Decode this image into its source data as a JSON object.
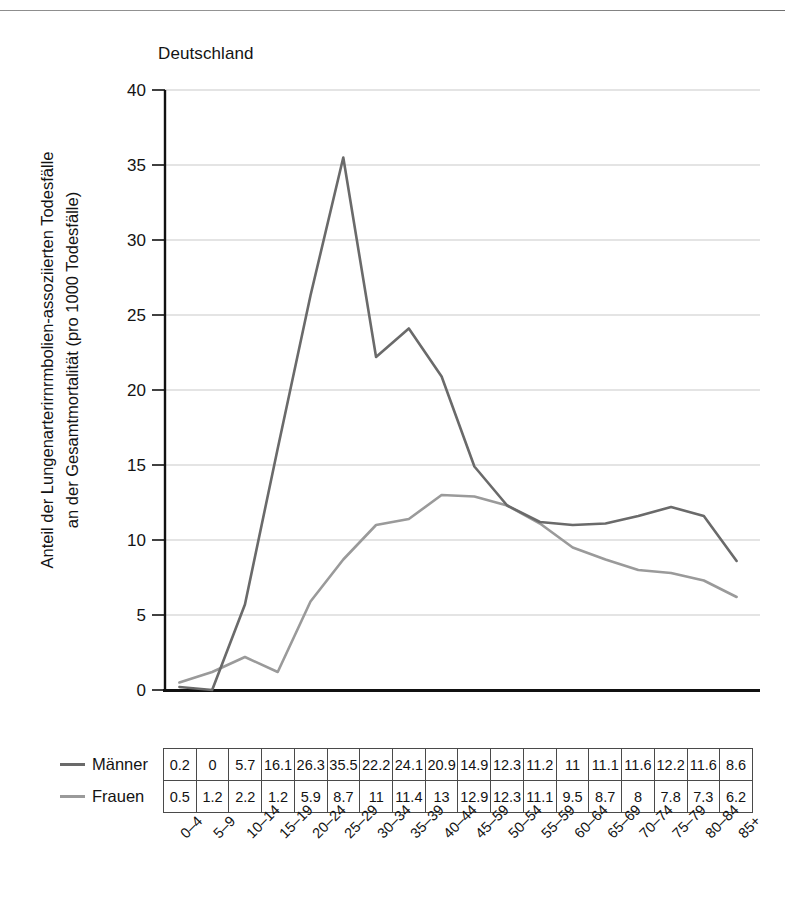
{
  "chart_title": "Deutschland",
  "axis": {
    "ylabel_line1": "Anteil der Lungenarterirnrmbolien-assoziierten Todesfälle",
    "ylabel_line2": "an der Gesamtmortalität (pro 1000 Todesfälle)",
    "yticks": [
      "40",
      "35",
      "30",
      "25",
      "20",
      "15",
      "10",
      "5",
      "0"
    ]
  },
  "legend": {
    "items": [
      {
        "label": "Männer",
        "color": "#6a6a6a"
      },
      {
        "label": "Frauen",
        "color": "#9a9a9a"
      }
    ]
  },
  "colors": {
    "maenner_line": "#6a6a6a",
    "frauen_line": "#9a9a9a",
    "gridline": "#c9c9c9",
    "axis": "#111111",
    "table_border": "#4a4a4a"
  },
  "chart_data": {
    "type": "line",
    "title": "Deutschland",
    "xlabel": "",
    "ylabel": "Anteil der Lungenarterirnrmbolien-assoziierten Todesfälle an der Gesamtmortalität (pro 1000 Todesfälle)",
    "categories": [
      "0–4",
      "5–9",
      "10–14",
      "15–19",
      "20–24",
      "25–29",
      "30–34",
      "35–39",
      "40–44",
      "45–59",
      "50–54",
      "55–59",
      "60–64",
      "65–69",
      "70–74",
      "75–79",
      "80–84",
      "85+"
    ],
    "series": [
      {
        "name": "Männer",
        "color": "#6a6a6a",
        "values": [
          0.2,
          0,
          5.7,
          16.1,
          26.3,
          35.5,
          22.2,
          24.1,
          20.9,
          14.9,
          12.3,
          11.2,
          11,
          11.1,
          11.6,
          12.2,
          11.6,
          8.6
        ]
      },
      {
        "name": "Frauen",
        "color": "#9a9a9a",
        "values": [
          0.5,
          1.2,
          2.2,
          1.2,
          5.9,
          8.7,
          11,
          11.4,
          13,
          12.9,
          12.3,
          11.1,
          9.5,
          8.7,
          8,
          7.8,
          7.3,
          6.2
        ]
      }
    ],
    "ylim": [
      0,
      40
    ],
    "ytick_step": 5,
    "grid": true,
    "legend_position": "below-left",
    "table_below": true
  }
}
